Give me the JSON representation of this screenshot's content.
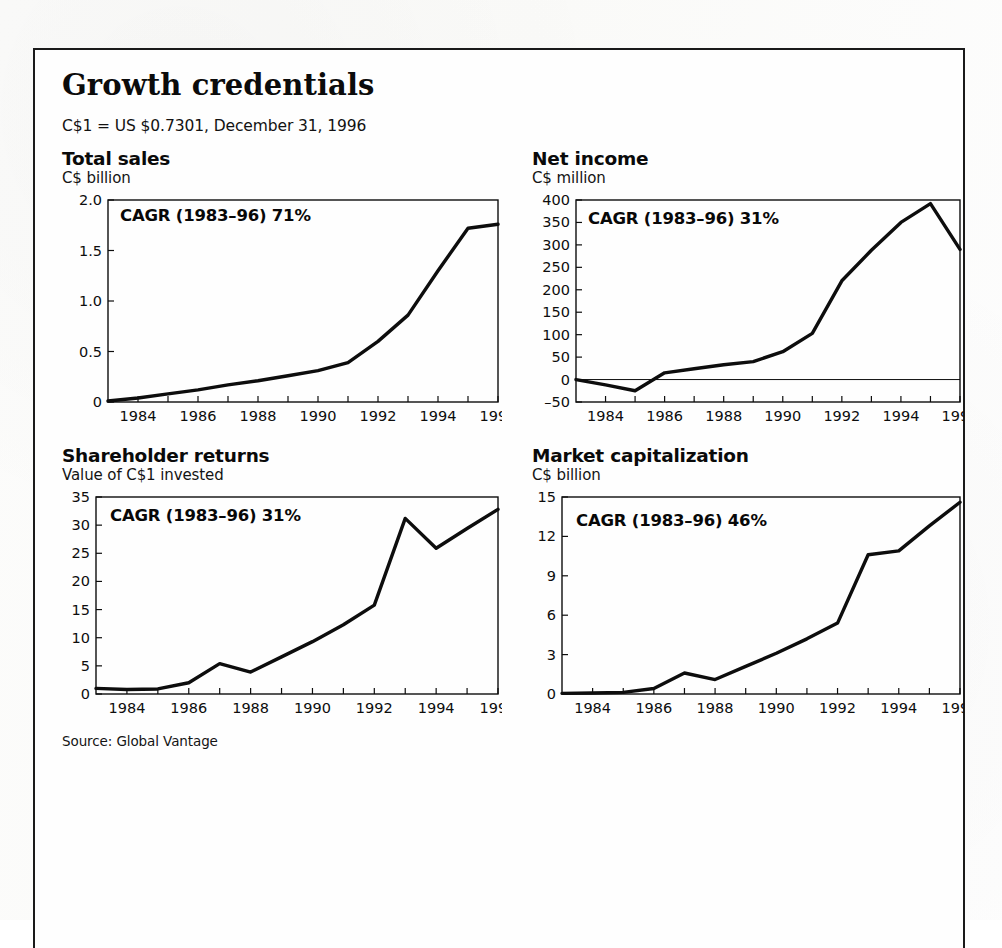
{
  "exhibit": {
    "title": "Growth credentials",
    "fx_note": "C$1 = US $0.7301, December 31, 1996",
    "source": "Source: Global Vantage",
    "border_color": "#1a1a1a",
    "line_color": "#0d0d0d",
    "paper_color": "#fdfdfc"
  },
  "chart_data": [
    {
      "type": "line",
      "title": "Total sales",
      "subtitle": "C$ billion",
      "annotation": "CAGR (1983–96) 71%",
      "xlabel": "",
      "ylabel": "C$ billion",
      "ylim": [
        0,
        2.0
      ],
      "yticks": [
        0,
        0.5,
        1.0,
        1.5,
        2.0
      ],
      "ytick_labels": [
        "0",
        "0.5",
        "1.0",
        "1.5",
        "2.0"
      ],
      "xlim": [
        1983,
        1996
      ],
      "xticks": [
        1983,
        1984,
        1985,
        1986,
        1987,
        1988,
        1989,
        1990,
        1991,
        1992,
        1993,
        1994,
        1995,
        1996
      ],
      "xtick_labels": [
        "1984",
        "1986",
        "1988",
        "1990",
        "1992",
        "1994",
        "1996"
      ],
      "xtick_label_years": [
        1984,
        1986,
        1988,
        1990,
        1992,
        1994,
        1996
      ],
      "grid": false,
      "legend": "none",
      "x": [
        1983,
        1984,
        1985,
        1986,
        1987,
        1988,
        1989,
        1990,
        1991,
        1992,
        1993,
        1994,
        1995,
        1996
      ],
      "values": [
        0.01,
        0.04,
        0.08,
        0.12,
        0.17,
        0.21,
        0.26,
        0.31,
        0.39,
        0.6,
        0.86,
        1.3,
        1.72,
        1.76
      ]
    },
    {
      "type": "line",
      "title": "Net income",
      "subtitle": "C$ million",
      "annotation": "CAGR (1983–96) 31%",
      "xlabel": "",
      "ylabel": "C$ million",
      "ylim": [
        -50,
        400
      ],
      "yticks": [
        -50,
        0,
        50,
        100,
        150,
        200,
        250,
        300,
        350,
        400
      ],
      "ytick_labels": [
        "–50",
        "0",
        "50",
        "100",
        "150",
        "200",
        "250",
        "300",
        "350",
        "400"
      ],
      "xlim": [
        1983,
        1996
      ],
      "xticks": [
        1983,
        1984,
        1985,
        1986,
        1987,
        1988,
        1989,
        1990,
        1991,
        1992,
        1993,
        1994,
        1995,
        1996
      ],
      "xtick_labels": [
        "1984",
        "1986",
        "1988",
        "1990",
        "1992",
        "1994",
        "1996"
      ],
      "xtick_label_years": [
        1984,
        1986,
        1988,
        1990,
        1992,
        1994,
        1996
      ],
      "zero_line": true,
      "grid": false,
      "legend": "none",
      "x": [
        1983,
        1984,
        1985,
        1986,
        1987,
        1988,
        1989,
        1990,
        1991,
        1992,
        1993,
        1994,
        1995,
        1996
      ],
      "values": [
        0,
        -12,
        -25,
        15,
        24,
        33,
        40,
        62,
        103,
        220,
        288,
        350,
        392,
        290
      ]
    },
    {
      "type": "line",
      "title": "Shareholder returns",
      "subtitle": "Value of C$1 invested",
      "annotation": "CAGR (1983–96) 31%",
      "xlabel": "",
      "ylabel": "Value of C$1 invested",
      "ylim": [
        0,
        35
      ],
      "yticks": [
        0,
        5,
        10,
        15,
        20,
        25,
        30,
        35
      ],
      "ytick_labels": [
        "0",
        "5",
        "10",
        "15",
        "20",
        "25",
        "30",
        "35"
      ],
      "xlim": [
        1983,
        1996
      ],
      "xticks": [
        1983,
        1984,
        1985,
        1986,
        1987,
        1988,
        1989,
        1990,
        1991,
        1992,
        1993,
        1994,
        1995,
        1996
      ],
      "xtick_labels": [
        "1984",
        "1986",
        "1988",
        "1990",
        "1992",
        "1994",
        "1996"
      ],
      "xtick_label_years": [
        1984,
        1986,
        1988,
        1990,
        1992,
        1994,
        1996
      ],
      "grid": false,
      "legend": "none",
      "x": [
        1983,
        1984,
        1985,
        1986,
        1987,
        1988,
        1989,
        1990,
        1991,
        1992,
        1993,
        1994,
        1995,
        1996
      ],
      "values": [
        1.0,
        0.8,
        0.9,
        2.0,
        5.4,
        3.9,
        6.6,
        9.3,
        12.3,
        15.8,
        31.2,
        25.9,
        29.4,
        32.8
      ]
    },
    {
      "type": "line",
      "title": "Market capitalization",
      "subtitle": "C$ billion",
      "annotation": "CAGR (1983–96) 46%",
      "xlabel": "",
      "ylabel": "C$ billion",
      "ylim": [
        0,
        15
      ],
      "yticks": [
        0,
        3,
        6,
        9,
        12,
        15
      ],
      "ytick_labels": [
        "0",
        "3",
        "6",
        "9",
        "12",
        "15"
      ],
      "xlim": [
        1983,
        1996
      ],
      "xticks": [
        1983,
        1984,
        1985,
        1986,
        1987,
        1988,
        1989,
        1990,
        1991,
        1992,
        1993,
        1994,
        1995,
        1996
      ],
      "xtick_labels": [
        "1984",
        "1986",
        "1988",
        "1990",
        "1992",
        "1994",
        "1996"
      ],
      "xtick_label_years": [
        1984,
        1986,
        1988,
        1990,
        1992,
        1994,
        1996
      ],
      "grid": false,
      "legend": "none",
      "x": [
        1983,
        1984,
        1985,
        1986,
        1987,
        1988,
        1989,
        1990,
        1991,
        1992,
        1993,
        1994,
        1995,
        1996
      ],
      "values": [
        0.05,
        0.08,
        0.12,
        0.42,
        1.6,
        1.1,
        2.1,
        3.1,
        4.2,
        5.4,
        10.6,
        10.9,
        12.8,
        14.6
      ]
    }
  ]
}
